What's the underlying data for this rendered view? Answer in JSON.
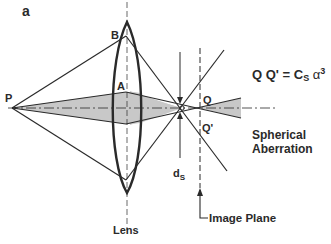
{
  "figure": {
    "panel_label": "a",
    "title": "Spherical Aberration"
  },
  "points": {
    "P": "P",
    "A": "A",
    "B": "B",
    "Q": "Q",
    "Q_prime": "Q'"
  },
  "formula": {
    "lhs": "Q Q'",
    "equals": "=",
    "C": "C",
    "C_sub": "S",
    "alpha": "α",
    "alpha_sup": "3"
  },
  "labels": {
    "spherical_line1": "Spherical",
    "spherical_line2": "Aberration",
    "ds_main": "d",
    "ds_sub": "S",
    "lens": "Lens",
    "image_plane": "Image Plane"
  },
  "colors": {
    "line": "#2a2a2a",
    "shade": "#c8c8c8",
    "background": "#ffffff"
  }
}
